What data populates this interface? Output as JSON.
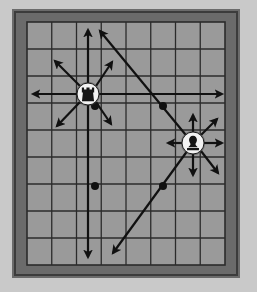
{
  "diagram": {
    "colors": {
      "page_background": "#c9c9c9",
      "frame_outer": "#6b6b6b",
      "frame_inner_shadow": "#3c3c3c",
      "board_fill": "#9a9a9a",
      "grid_line": "#2b2b2b",
      "arrow": "#111111",
      "piece_disc": "#f2f2f2",
      "piece_glyph": "#151515",
      "dot_marker": "#111111"
    },
    "board": {
      "name": "game-board",
      "columns": 8,
      "rows": 9,
      "left": 27,
      "top": 22,
      "width": 198,
      "height": 243,
      "cell_width": 24.75,
      "cell_height": 27
    },
    "frame": {
      "name": "board-frame",
      "left": 12,
      "top": 9,
      "width": 228,
      "height": 269,
      "thickness": 15
    },
    "pieces": [
      {
        "id": "piece-left",
        "name": "rook-piece",
        "glyph": "rook",
        "label": "Rook",
        "cx": 88,
        "cy": 94,
        "radius": 11,
        "move_type": "eight-direction",
        "column": 3,
        "row": 3
      },
      {
        "id": "piece-right",
        "name": "bishop-piece",
        "glyph": "bishop",
        "label": "Bishop",
        "cx": 193,
        "cy": 143,
        "radius": 11,
        "move_type": "eight-direction",
        "column": 7,
        "row": 5
      }
    ],
    "dots": [
      {
        "name": "dot-marker-a",
        "cx": 95,
        "cy": 106,
        "r": 4
      },
      {
        "name": "dot-marker-b",
        "cx": 95,
        "cy": 186,
        "r": 4
      },
      {
        "name": "dot-marker-c",
        "cx": 163,
        "cy": 106,
        "r": 4
      },
      {
        "name": "dot-marker-d",
        "cx": 163,
        "cy": 186,
        "r": 4
      }
    ],
    "arrows": [
      {
        "name": "arrow-left-piece-north",
        "x1": 88,
        "y1": 83,
        "x2": 88,
        "y2": 30,
        "head": "end"
      },
      {
        "name": "arrow-left-piece-south",
        "x1": 88,
        "y1": 105,
        "x2": 88,
        "y2": 257,
        "head": "end"
      },
      {
        "name": "arrow-left-piece-west",
        "x1": 77,
        "y1": 94,
        "x2": 33,
        "y2": 94,
        "head": "end"
      },
      {
        "name": "arrow-left-piece-east",
        "x1": 99,
        "y1": 94,
        "x2": 222,
        "y2": 94,
        "head": "end"
      },
      {
        "name": "arrow-left-piece-northwest",
        "x1": 80,
        "y1": 86,
        "x2": 55,
        "y2": 61,
        "head": "end"
      },
      {
        "name": "arrow-left-piece-northeast",
        "x1": 96,
        "y1": 86,
        "x2": 112,
        "y2": 62,
        "head": "end"
      },
      {
        "name": "arrow-left-piece-southwest",
        "x1": 80,
        "y1": 102,
        "x2": 57,
        "y2": 126,
        "head": "end"
      },
      {
        "name": "arrow-left-piece-southeast",
        "x1": 96,
        "y1": 102,
        "x2": 111,
        "y2": 124,
        "head": "end"
      },
      {
        "name": "arrow-long-diagonal-upleft",
        "x1": 190,
        "y1": 140,
        "x2": 100,
        "y2": 31,
        "head": "end"
      },
      {
        "name": "arrow-long-diagonal-downleft",
        "x1": 188,
        "y1": 150,
        "x2": 113,
        "y2": 253,
        "head": "end"
      },
      {
        "name": "arrow-right-piece-north",
        "x1": 193,
        "y1": 132,
        "x2": 193,
        "y2": 115,
        "head": "end"
      },
      {
        "name": "arrow-right-piece-south",
        "x1": 193,
        "y1": 154,
        "x2": 193,
        "y2": 175,
        "head": "end"
      },
      {
        "name": "arrow-right-piece-west",
        "x1": 182,
        "y1": 143,
        "x2": 168,
        "y2": 143,
        "head": "end"
      },
      {
        "name": "arrow-right-piece-east",
        "x1": 204,
        "y1": 143,
        "x2": 222,
        "y2": 143,
        "head": "end"
      },
      {
        "name": "arrow-right-piece-northeast",
        "x1": 201,
        "y1": 135,
        "x2": 217,
        "y2": 119,
        "head": "end"
      },
      {
        "name": "arrow-right-piece-southeast",
        "x1": 201,
        "y1": 151,
        "x2": 218,
        "y2": 173,
        "head": "end"
      }
    ]
  }
}
